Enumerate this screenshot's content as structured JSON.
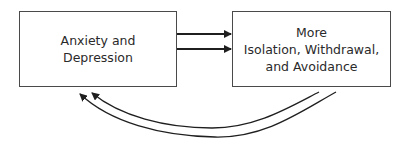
{
  "diagram": {
    "type": "cycle-flow",
    "nodes": [
      {
        "id": "anxiety",
        "label": "Anxiety and\nDepression"
      },
      {
        "id": "isolation",
        "label": "More\nIsolation, Withdrawal,\nand Avoidance"
      }
    ],
    "edges": [
      {
        "from": "anxiety",
        "to": "isolation",
        "style": "double-straight-arrow"
      },
      {
        "from": "isolation",
        "to": "anxiety",
        "style": "double-curved-arrow"
      }
    ],
    "colors": {
      "stroke": "#1f1f1f",
      "box_border": "#4a4a4a",
      "text": "#2a2a2a"
    }
  }
}
